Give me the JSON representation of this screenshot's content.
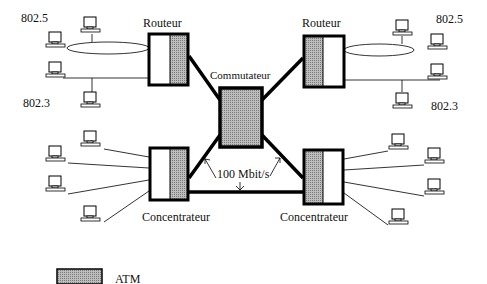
{
  "diagram": {
    "type": "network-architecture",
    "nodes": {
      "router_left": {
        "label": "Routeur"
      },
      "router_right": {
        "label": "Routeur"
      },
      "switch": {
        "label": "Commutateur"
      },
      "hub_left": {
        "label": "Concentrateur"
      },
      "hub_right": {
        "label": "Concentrateur"
      }
    },
    "lan_labels": {
      "top_left": "802.5",
      "bottom_left": "802.3",
      "top_right": "802.5",
      "bottom_right": "802.3"
    },
    "link_speed": "100 Mbit/s",
    "legend": {
      "label": "ATM",
      "swatch_color": "#a8a8a8"
    },
    "colors": {
      "stroke": "#000000",
      "atm_fill": "#a8a8a8",
      "background": "#ffffff"
    }
  }
}
